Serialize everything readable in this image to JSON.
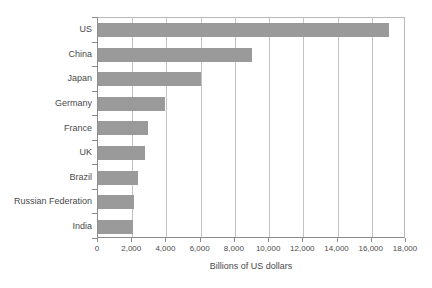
{
  "chart_data": {
    "type": "bar",
    "orientation": "horizontal",
    "title": "",
    "xlabel": "Billions of US dollars",
    "ylabel": "",
    "xlim": [
      0,
      18000
    ],
    "xticks": [
      0,
      2000,
      4000,
      6000,
      8000,
      10000,
      12000,
      14000,
      16000,
      18000
    ],
    "xtick_labels": [
      "0",
      "2,000",
      "4,000",
      "6,000",
      "8,000",
      "10,000",
      "12,000",
      "14,000",
      "16,000",
      "18,000"
    ],
    "grid": "vertical",
    "legend": "none",
    "bar_color": "#9a9a9a",
    "categories": [
      "US",
      "China",
      "Japan",
      "Germany",
      "France",
      "UK",
      "Brazil",
      "Russian Federation",
      "India"
    ],
    "values": [
      17000,
      9000,
      6000,
      3900,
      2900,
      2750,
      2350,
      2100,
      2050
    ]
  }
}
